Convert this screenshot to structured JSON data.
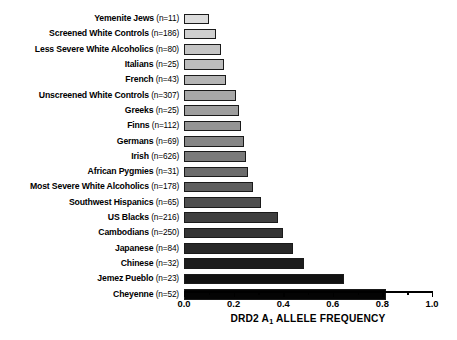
{
  "chart_data": {
    "type": "bar",
    "orientation": "horizontal",
    "title": "",
    "xlabel": "DRD2 A₁ ALLELE FREQUENCY",
    "xlabel_prefix": "DRD2 A",
    "xlabel_subscript": "1",
    "xlabel_suffix": " ALLELE FREQUENCY",
    "ylabel": "",
    "xlim": [
      0.0,
      1.0
    ],
    "xticks": [
      0.0,
      0.2,
      0.4,
      0.6,
      0.8,
      1.0
    ],
    "xtick_labels": [
      "0.0",
      "0.2",
      "0.4",
      "0.6",
      "0.8",
      "1.0"
    ],
    "minor_xticks": [
      0.1,
      0.3,
      0.5,
      0.7,
      0.9
    ],
    "grid": false,
    "legend": "none",
    "categories": [
      "Yemenite Jews",
      "Screened White Controls",
      "Less Severe White Alcoholics",
      "Italians",
      "French",
      "Unscreened White Controls",
      "Greeks",
      "Finns",
      "Germans",
      "Irish",
      "African Pygmies",
      "Most Severe White Alcoholics",
      "Southwest Hispanics",
      "US Blacks",
      "Cambodians",
      "Japanese",
      "Chinese",
      "Jemez Pueblo",
      "Cheyenne"
    ],
    "sample_sizes": [
      11,
      186,
      80,
      25,
      43,
      307,
      25,
      112,
      69,
      626,
      31,
      178,
      65,
      216,
      250,
      84,
      32,
      23,
      52
    ],
    "values": [
      0.1,
      0.13,
      0.15,
      0.16,
      0.17,
      0.21,
      0.22,
      0.23,
      0.24,
      0.25,
      0.26,
      0.28,
      0.31,
      0.38,
      0.4,
      0.44,
      0.485,
      0.645,
      0.815
    ],
    "bar_colors": [
      "#dcdcdc",
      "#cfcfcf",
      "#c4c4c4",
      "#bcbcbc",
      "#b4b4b4",
      "#a8a8a8",
      "#9e9e9e",
      "#949494",
      "#868686",
      "#7a7a7a",
      "#6c6c6c",
      "#5e5e5e",
      "#4f4f4f",
      "#3f3f3f",
      "#343434",
      "#282828",
      "#1c1c1c",
      "#111111",
      "#040404"
    ],
    "bar_edge_color": "#1a1a1a",
    "axis_color": "#000000",
    "background": "#ffffff",
    "rows": [
      {
        "label": "Yemenite Jews",
        "n": "(n=11)",
        "value": 0.1,
        "color": "#dcdcdc"
      },
      {
        "label": "Screened White Controls",
        "n": "(n=186)",
        "value": 0.13,
        "color": "#cfcfcf"
      },
      {
        "label": "Less Severe White Alcoholics",
        "n": "(n=80)",
        "value": 0.15,
        "color": "#c4c4c4"
      },
      {
        "label": "Italians",
        "n": "(n=25)",
        "value": 0.16,
        "color": "#bcbcbc"
      },
      {
        "label": "French",
        "n": "(n=43)",
        "value": 0.17,
        "color": "#b4b4b4"
      },
      {
        "label": "Unscreened White Controls",
        "n": "(n=307)",
        "value": 0.21,
        "color": "#a8a8a8"
      },
      {
        "label": "Greeks",
        "n": "(n=25)",
        "value": 0.22,
        "color": "#9e9e9e"
      },
      {
        "label": "Finns",
        "n": "(n=112)",
        "value": 0.23,
        "color": "#949494"
      },
      {
        "label": "Germans",
        "n": "(n=69)",
        "value": 0.24,
        "color": "#868686"
      },
      {
        "label": "Irish",
        "n": "(n=626)",
        "value": 0.25,
        "color": "#7a7a7a"
      },
      {
        "label": "African Pygmies",
        "n": "(n=31)",
        "value": 0.26,
        "color": "#6c6c6c"
      },
      {
        "label": "Most Severe White Alcoholics",
        "n": "(n=178)",
        "value": 0.28,
        "color": "#5e5e5e"
      },
      {
        "label": "Southwest Hispanics",
        "n": "(n=65)",
        "value": 0.31,
        "color": "#4f4f4f"
      },
      {
        "label": "US Blacks",
        "n": "(n=216)",
        "value": 0.38,
        "color": "#3f3f3f"
      },
      {
        "label": "Cambodians",
        "n": "(n=250)",
        "value": 0.4,
        "color": "#343434"
      },
      {
        "label": "Japanese",
        "n": "(n=84)",
        "value": 0.44,
        "color": "#282828"
      },
      {
        "label": "Chinese",
        "n": "(n=32)",
        "value": 0.485,
        "color": "#1c1c1c"
      },
      {
        "label": "Jemez Pueblo",
        "n": "(n=23)",
        "value": 0.645,
        "color": "#111111"
      },
      {
        "label": "Cheyenne",
        "n": "(n=52)",
        "value": 0.815,
        "color": "#040404"
      }
    ]
  }
}
